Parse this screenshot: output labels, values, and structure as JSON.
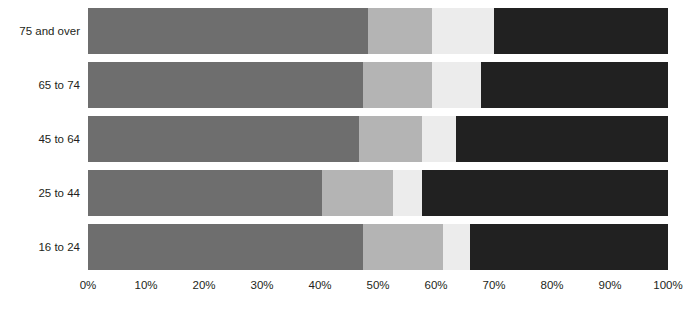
{
  "chart_data": {
    "type": "bar",
    "orientation": "horizontal",
    "stacked": true,
    "normalized": true,
    "title": "",
    "subtitle": "",
    "xlabel": "",
    "ylabel": "",
    "grid": false,
    "legend_position": "none",
    "xlim": [
      0,
      100
    ],
    "x_tick_labels": [
      "0%",
      "10%",
      "20%",
      "30%",
      "40%",
      "50%",
      "60%",
      "70%",
      "80%",
      "90%",
      "100%"
    ],
    "x_tick_values": [
      0,
      10,
      20,
      30,
      40,
      50,
      60,
      70,
      80,
      90,
      100
    ],
    "categories": [
      "75 and over",
      "65 to 74",
      "45 to 64",
      "25 to 44",
      "16 to 24"
    ],
    "category_order_top_to_bottom": [
      "75 and over",
      "65 to 74",
      "45 to 64",
      "25 to 44",
      "16 to 24"
    ],
    "series": [
      {
        "name": "series-1",
        "color": "#6e6e6e",
        "values": [
          48.3,
          47.4,
          46.7,
          40.3,
          47.4
        ]
      },
      {
        "name": "series-2",
        "color": "#b4b4b4",
        "values": [
          11.0,
          11.9,
          10.9,
          12.3,
          13.8
        ]
      },
      {
        "name": "series-3",
        "color": "#ececec",
        "values": [
          10.7,
          8.5,
          5.8,
          5.0,
          4.7
        ]
      },
      {
        "name": "series-4",
        "color": "#212121",
        "values": [
          30.0,
          32.2,
          36.6,
          42.4,
          34.1
        ]
      }
    ],
    "cumulative_boundaries_pct": [
      [
        48.3,
        59.3,
        70.0,
        100
      ],
      [
        47.4,
        59.3,
        67.8,
        100
      ],
      [
        46.7,
        57.6,
        63.4,
        100
      ],
      [
        40.3,
        52.6,
        57.6,
        100
      ],
      [
        47.4,
        61.2,
        65.9,
        100
      ]
    ]
  },
  "colors": {
    "series_1": "#6e6e6e",
    "series_2": "#b4b4b4",
    "series_3": "#ececec",
    "series_4": "#212121",
    "background": "#ffffff",
    "text": "#231f20"
  }
}
